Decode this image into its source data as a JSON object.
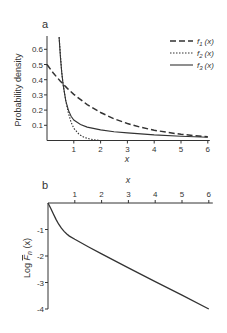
{
  "chart_data": [
    {
      "panel": "a",
      "type": "line",
      "title": "",
      "xlabel": "x",
      "ylabel": "Probability density",
      "xlim": [
        0,
        6
      ],
      "ylim": [
        0,
        0.68
      ],
      "xticks": [
        "1",
        "2",
        "3",
        "4",
        "5",
        "6"
      ],
      "yticks": [
        "0.1",
        "0.2",
        "0.3",
        "0.4",
        "0.5",
        "0.6"
      ],
      "grid": false,
      "legend_position": "upper right",
      "series": [
        {
          "name": "f1 (x)",
          "style": "dashed",
          "x": [
            0,
            0.25,
            0.5,
            0.75,
            1,
            1.5,
            2,
            2.5,
            3,
            3.5,
            4,
            4.5,
            5,
            5.5,
            6
          ],
          "y": [
            0.5,
            0.44,
            0.39,
            0.345,
            0.303,
            0.236,
            0.184,
            0.143,
            0.112,
            0.087,
            0.068,
            0.053,
            0.041,
            0.032,
            0.025
          ]
        },
        {
          "name": "f2 (x)",
          "style": "dotted",
          "x": [
            0.45,
            0.55,
            0.6,
            0.7,
            0.8,
            0.9,
            1.0,
            1.2,
            1.4,
            1.6,
            1.8,
            2.0
          ],
          "y": [
            0.68,
            0.45,
            0.37,
            0.26,
            0.18,
            0.12,
            0.08,
            0.04,
            0.02,
            0.01,
            0.004,
            0.0
          ]
        },
        {
          "name": "f3 (x)",
          "style": "solid",
          "x": [
            0.45,
            0.5,
            0.55,
            0.6,
            0.7,
            0.8,
            0.9,
            1.0,
            1.25,
            1.5,
            2,
            2.5,
            3,
            4,
            5,
            6
          ],
          "y": [
            0.68,
            0.55,
            0.45,
            0.37,
            0.26,
            0.2,
            0.16,
            0.135,
            0.105,
            0.088,
            0.07,
            0.058,
            0.05,
            0.037,
            0.028,
            0.022
          ]
        }
      ]
    },
    {
      "panel": "b",
      "type": "line",
      "title": "",
      "xlabel": "x",
      "ylabel": "Log F̄n (x)",
      "xlim": [
        0,
        6
      ],
      "ylim": [
        -4,
        0
      ],
      "xticks": [
        "1",
        "2",
        "3",
        "4",
        "5",
        "6"
      ],
      "yticks": [
        "-1",
        "-2",
        "-3",
        "-4"
      ],
      "grid": false,
      "series": [
        {
          "name": "Log F̄n (x)",
          "style": "solid",
          "x": [
            0,
            0.1,
            0.2,
            0.3,
            0.4,
            0.5,
            0.6,
            0.7,
            0.8,
            1.0,
            1.5,
            2,
            3,
            4,
            5,
            6
          ],
          "y": [
            0,
            -0.2,
            -0.42,
            -0.62,
            -0.8,
            -0.95,
            -1.07,
            -1.17,
            -1.25,
            -1.37,
            -1.65,
            -1.92,
            -2.45,
            -2.97,
            -3.48,
            -4.0
          ]
        }
      ]
    }
  ],
  "panels": {
    "a": {
      "label": "a",
      "xlabel": "x",
      "ylabel": "Probability density",
      "legend": [
        {
          "name": "f",
          "sub": "1",
          "arg": "(x)"
        },
        {
          "name": "f",
          "sub": "2",
          "arg": "(x)"
        },
        {
          "name": "f",
          "sub": "3",
          "arg": "(x)"
        }
      ]
    },
    "b": {
      "label": "b",
      "xlabel": "x",
      "ylabel_main": "Log ",
      "ylabel_F": "F",
      "ylabel_sub": "n",
      "ylabel_arg": " (x)"
    }
  },
  "colors": {
    "line": "#333333",
    "axis": "#333333",
    "background": "#ffffff"
  }
}
